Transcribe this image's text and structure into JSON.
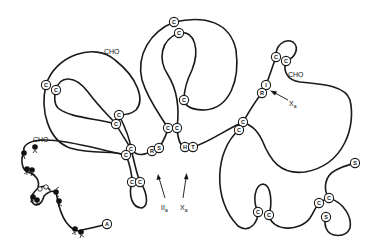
{
  "diagram": {
    "type": "protein chain schematic",
    "colors": {
      "line": "#1a1a1a",
      "background": "#ffffff"
    },
    "residues": [
      {
        "id": "c1",
        "letter": "C",
        "x": 46,
        "y": 85
      },
      {
        "id": "c2",
        "letter": "C",
        "x": 56,
        "y": 90
      },
      {
        "id": "c3",
        "letter": "C",
        "x": 119,
        "y": 115
      },
      {
        "id": "c4",
        "letter": "C",
        "x": 116,
        "y": 124
      },
      {
        "id": "c5",
        "letter": "C",
        "x": 174,
        "y": 22
      },
      {
        "id": "c6",
        "letter": "C",
        "x": 179,
        "y": 33
      },
      {
        "id": "c7",
        "letter": "C",
        "x": 184,
        "y": 100
      },
      {
        "id": "c8",
        "letter": "C",
        "x": 168,
        "y": 128
      },
      {
        "id": "c9",
        "letter": "C",
        "x": 177,
        "y": 128
      },
      {
        "id": "c10",
        "letter": "C",
        "x": 131,
        "y": 149
      },
      {
        "id": "c11",
        "letter": "C",
        "x": 126,
        "y": 155
      },
      {
        "id": "r1",
        "letter": "R",
        "x": 152,
        "y": 151
      },
      {
        "id": "s1",
        "letter": "S",
        "x": 159,
        "y": 148
      },
      {
        "id": "h1",
        "letter": "H",
        "x": 185,
        "y": 147
      },
      {
        "id": "t1",
        "letter": "T",
        "x": 193,
        "y": 147
      },
      {
        "id": "c12",
        "letter": "C",
        "x": 132,
        "y": 182
      },
      {
        "id": "c13",
        "letter": "C",
        "x": 140,
        "y": 182
      },
      {
        "id": "c14",
        "letter": "C",
        "x": 243,
        "y": 122
      },
      {
        "id": "c15",
        "letter": "C",
        "x": 239,
        "y": 130
      },
      {
        "id": "c16",
        "letter": "C",
        "x": 276,
        "y": 57
      },
      {
        "id": "c17",
        "letter": "C",
        "x": 286,
        "y": 61
      },
      {
        "id": "i1",
        "letter": "I",
        "x": 266,
        "y": 85
      },
      {
        "id": "r2",
        "letter": "R",
        "x": 262,
        "y": 93
      },
      {
        "id": "c18",
        "letter": "C",
        "x": 258,
        "y": 212
      },
      {
        "id": "c19",
        "letter": "C",
        "x": 269,
        "y": 215
      },
      {
        "id": "c20",
        "letter": "C",
        "x": 319,
        "y": 203
      },
      {
        "id": "c21",
        "letter": "C",
        "x": 329,
        "y": 198
      },
      {
        "id": "s2",
        "letter": "S",
        "x": 326,
        "y": 217
      },
      {
        "id": "s3",
        "letter": "S",
        "x": 355,
        "y": 163
      },
      {
        "id": "a1",
        "letter": "A",
        "x": 107,
        "y": 224
      }
    ],
    "labels": [
      {
        "id": "cho1",
        "text": "CHO",
        "x": 104,
        "y": 54
      },
      {
        "id": "cho2",
        "text": "CHO",
        "x": 33,
        "y": 142
      },
      {
        "id": "cho3",
        "text": "CHO",
        "x": 288,
        "y": 77
      },
      {
        "id": "IIa",
        "main": "II",
        "sub": "a",
        "x": 161,
        "y": 207
      },
      {
        "id": "Xa1",
        "main": "X",
        "sub": "a",
        "x": 182,
        "y": 207
      },
      {
        "id": "Xa2",
        "main": "X",
        "sub": "a",
        "x": 290,
        "y": 104
      }
    ]
  }
}
